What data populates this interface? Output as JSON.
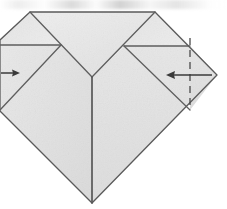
{
  "figure": {
    "title": "Origami folding diagram step",
    "canvas": {
      "width": 227,
      "height": 209
    },
    "background_color": "#ffffff",
    "paper": {
      "fill_color": "#e3e3e3",
      "fill_color_light": "#eaeaea",
      "fill_color_shade": "#dcdcdc",
      "stroke_color": "#5a5a5a",
      "stroke_width": 1.3,
      "outline_points": "30,12 155,12 217,75 92,203 0,111 0,40",
      "outline_label": "folded paper silhouette"
    },
    "creases": [
      {
        "name": "left-flap-fold",
        "style": "solid",
        "points": "30,12 92,77",
        "label": "left flap diagonal crease"
      },
      {
        "name": "right-flap-fold",
        "style": "solid",
        "points": "155,12 92,77",
        "label": "right flap diagonal crease"
      },
      {
        "name": "center-vertical-crease",
        "style": "solid",
        "points": "92,77 92,203",
        "label": "center vertical crease"
      },
      {
        "name": "left-upper-edge",
        "style": "solid",
        "points": "61,45 0,45",
        "label": "left raw edge"
      },
      {
        "name": "right-upper-edge",
        "style": "solid",
        "points": "124,46 190,46",
        "label": "right raw edge"
      },
      {
        "name": "left-layer-edge",
        "style": "solid",
        "points": "61,45 0,110",
        "label": "left layer boundary"
      },
      {
        "name": "right-layer-edge",
        "style": "solid",
        "points": "124,46 190,110",
        "label": "right layer boundary"
      }
    ],
    "dashed_lines": [
      {
        "name": "right-fold-guide",
        "style": "dashed",
        "points": "190,38 190,110",
        "dash_pattern": "7,5",
        "label": "valley fold guide line"
      }
    ],
    "arrows": [
      {
        "name": "left-fold-arrow",
        "direction": "right",
        "from": "1,73",
        "to": "19,73",
        "label": "fold left side inward"
      },
      {
        "name": "right-fold-arrow",
        "direction": "left",
        "from": "212,75",
        "to": "167,75",
        "label": "fold right side inward"
      }
    ],
    "artifacts": [
      {
        "name": "scan-smudge-top",
        "label": "faint scan artifact at top edge"
      }
    ]
  }
}
